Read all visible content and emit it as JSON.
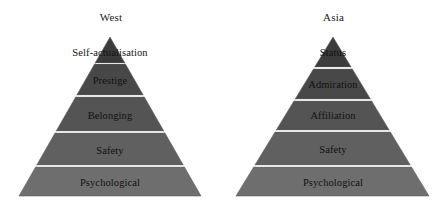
{
  "figure": {
    "background_color": "#ffffff",
    "divider_color": "#e8e8e4",
    "outline_color": "#5f5f5f",
    "label_color": "#111111"
  },
  "pyramids": [
    {
      "id": "west",
      "title": "West",
      "apex_x": 110,
      "apex_y": 37,
      "base_left_x": 19,
      "base_right_x": 201,
      "base_y": 196,
      "tiers": [
        {
          "label": "Self-actualisation",
          "top_y": 37,
          "bottom_y": 63,
          "fill": "#3b3b3b",
          "label_y": 47,
          "overflow": true
        },
        {
          "label": "Prestige",
          "top_y": 64,
          "bottom_y": 95,
          "fill": "#484848",
          "label_y": 75,
          "overflow": false
        },
        {
          "label": "Belonging",
          "top_y": 97,
          "bottom_y": 131,
          "fill": "#545454",
          "label_y": 110,
          "overflow": false
        },
        {
          "label": "Safety",
          "top_y": 133,
          "bottom_y": 165,
          "fill": "#606060",
          "label_y": 145,
          "overflow": false
        },
        {
          "label": "Psychological",
          "top_y": 167,
          "bottom_y": 196,
          "fill": "#6e6e6e",
          "label_y": 177,
          "overflow": false
        }
      ]
    },
    {
      "id": "asia",
      "title": "Asia",
      "apex_x": 111,
      "apex_y": 37,
      "base_left_x": 14,
      "base_right_x": 207,
      "base_y": 196,
      "tiers": [
        {
          "label": "Status",
          "top_y": 37,
          "bottom_y": 67,
          "fill": "#3b3b3b",
          "label_y": 47,
          "overflow": true
        },
        {
          "label": "Admiration",
          "top_y": 69,
          "bottom_y": 99,
          "fill": "#484848",
          "label_y": 79,
          "overflow": false
        },
        {
          "label": "Affiliation",
          "top_y": 101,
          "bottom_y": 130,
          "fill": "#545454",
          "label_y": 110,
          "overflow": false
        },
        {
          "label": "Safety",
          "top_y": 132,
          "bottom_y": 165,
          "fill": "#606060",
          "label_y": 144,
          "overflow": false
        },
        {
          "label": "Psychological",
          "top_y": 167,
          "bottom_y": 196,
          "fill": "#6e6e6e",
          "label_y": 177,
          "overflow": false
        }
      ]
    }
  ],
  "chart_data": {
    "type": "pyramid",
    "title": "",
    "xlabel": "",
    "ylabel": "",
    "legend_position": "none",
    "grid": false,
    "panels": [
      {
        "name": "West",
        "levels_top_to_bottom": [
          "Self-actualisation",
          "Prestige",
          "Belonging",
          "Safety",
          "Psychological"
        ],
        "level_count": 5
      },
      {
        "name": "Asia",
        "levels_top_to_bottom": [
          "Status",
          "Admiration",
          "Affiliation",
          "Safety",
          "Psychological"
        ],
        "level_count": 5
      }
    ]
  }
}
